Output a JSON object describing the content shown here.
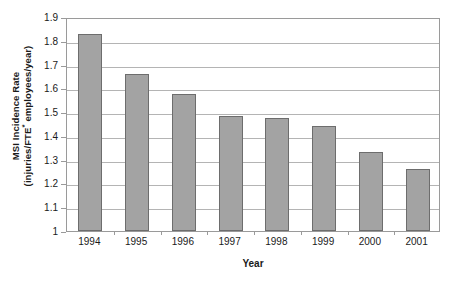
{
  "chart_data": {
    "type": "bar",
    "title": "",
    "xlabel": "Year",
    "ylabel_line1": "MSI Incidence Rate",
    "ylabel_line2_pre": "(injuries/FTE",
    "ylabel_line2_sup": "*",
    "ylabel_line2_post": " employees/year)",
    "ylabel_full": "MSI Incidence Rate (injuries/FTE* employees/year)",
    "categories": [
      "1994",
      "1995",
      "1996",
      "1997",
      "1998",
      "1999",
      "2000",
      "2001"
    ],
    "values": [
      1.83,
      1.66,
      1.575,
      1.483,
      1.475,
      1.443,
      1.334,
      1.262
    ],
    "ylim": [
      1.0,
      1.9
    ],
    "ytick_labels": [
      "1.9",
      "1.8",
      "1.7",
      "1.6",
      "1.5",
      "1.4",
      "1.3",
      "1.2",
      "1.1",
      "1"
    ],
    "ytick_values": [
      1.9,
      1.8,
      1.7,
      1.6,
      1.5,
      1.4,
      1.3,
      1.2,
      1.1,
      1.0
    ],
    "grid": true,
    "legend": "none",
    "bar_color": "#a3a3a3",
    "bar_border_color": "#6d6d6d",
    "gridline_color": "#b4b4b4",
    "axis_color": "#9a9a9a",
    "background_color": "#ffffff"
  }
}
